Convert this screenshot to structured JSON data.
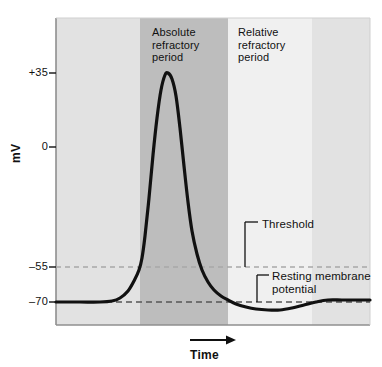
{
  "figure": {
    "background_color": "#ffffff"
  },
  "axes": {
    "y_title": "mV",
    "x_title": "Time",
    "y_ticks": [
      {
        "label": "+35",
        "value": 35,
        "y": 73
      },
      {
        "label": "0",
        "value": 0,
        "y": 147
      },
      {
        "label": "–55",
        "value": -55,
        "y": 267
      },
      {
        "label": "–70",
        "value": -70,
        "y": 302
      }
    ],
    "plot_rect": {
      "left": 56,
      "top": 18,
      "right": 370,
      "bottom": 325
    },
    "frame_color": "#8f8f8f"
  },
  "bands": [
    {
      "name": "pre-stimulus",
      "label": "",
      "x0": 56,
      "x1": 140,
      "color": "#e2e2e2"
    },
    {
      "name": "absolute-refractory",
      "label": "Absolute\nrefractory\nperiod",
      "x0": 140,
      "x1": 228,
      "color": "#bdbdbd",
      "label_x": 152,
      "label_y": 26
    },
    {
      "name": "relative-refractory",
      "label": "Relative\nrefractory\nperiod",
      "x0": 228,
      "x1": 312,
      "color": "#f0f0f0",
      "label_x": 238,
      "label_y": 26
    },
    {
      "name": "post-refractory",
      "label": "",
      "x0": 312,
      "x1": 370,
      "color": "#e2e2e2"
    }
  ],
  "reference_lines": [
    {
      "name": "threshold-line",
      "value": -55,
      "y": 267,
      "color": "#a8a8a8",
      "dash": "5,4"
    },
    {
      "name": "resting-potential-line",
      "value": -70,
      "y": 302,
      "color": "#555555",
      "dash": "6,4"
    }
  ],
  "annotations": [
    {
      "name": "threshold",
      "text": "Threshold",
      "label_x": 262,
      "label_y": 218,
      "leader": {
        "x": 245,
        "y_top": 222,
        "y_bottom": 267,
        "tick_x2": 258,
        "tick_y": 222
      }
    },
    {
      "name": "resting-membrane-potential",
      "text": "Resting membrane\npotential",
      "label_x": 272,
      "label_y": 270,
      "leader": {
        "x": 257,
        "y_top": 275,
        "y_bottom": 302,
        "tick_x2": 269,
        "tick_y": 275
      }
    }
  ],
  "time_arrow": {
    "name": "time-arrow",
    "x0": 190,
    "x1": 236,
    "y": 340
  },
  "curve": {
    "name": "action-potential-curve",
    "color": "#111111",
    "width": 3.2,
    "resting_mv": -70,
    "threshold_mv": -55,
    "peak_mv": 35,
    "undershoot_mv": -76,
    "points_px": [
      [
        56,
        302
      ],
      [
        80,
        302
      ],
      [
        100,
        302
      ],
      [
        112,
        301
      ],
      [
        120,
        298
      ],
      [
        128,
        291
      ],
      [
        134,
        281
      ],
      [
        139,
        270
      ],
      [
        142,
        258
      ],
      [
        145,
        236
      ],
      [
        149,
        198
      ],
      [
        153,
        155
      ],
      [
        157,
        118
      ],
      [
        161,
        90
      ],
      [
        165,
        75
      ],
      [
        168,
        73
      ],
      [
        172,
        79
      ],
      [
        176,
        96
      ],
      [
        180,
        128
      ],
      [
        184,
        166
      ],
      [
        188,
        202
      ],
      [
        192,
        231
      ],
      [
        197,
        254
      ],
      [
        202,
        270
      ],
      [
        208,
        282
      ],
      [
        214,
        290
      ],
      [
        221,
        296
      ],
      [
        228,
        300
      ],
      [
        236,
        304
      ],
      [
        246,
        307
      ],
      [
        256,
        309
      ],
      [
        268,
        310
      ],
      [
        280,
        310
      ],
      [
        292,
        308
      ],
      [
        304,
        305
      ],
      [
        316,
        302
      ],
      [
        328,
        300
      ],
      [
        342,
        300
      ],
      [
        356,
        300
      ],
      [
        370,
        300
      ]
    ]
  },
  "chart_data": {
    "type": "line",
    "xlabel": "Time",
    "ylabel": "mV",
    "ylim": [
      -90,
      50
    ],
    "ytick_values": [
      35,
      0,
      -55,
      -70
    ],
    "ytick_labels": [
      "+35",
      "0",
      "–55",
      "–70"
    ],
    "grid": false,
    "legend": "none",
    "series": [
      {
        "name": "Membrane potential",
        "x": [
          0,
          8,
          14,
          18,
          21,
          24,
          26,
          28,
          30,
          32,
          34,
          36,
          38,
          40,
          43,
          46,
          50,
          54,
          58,
          63,
          68,
          74,
          80,
          88,
          96,
          104,
          112,
          120,
          130,
          142,
          156,
          170,
          185,
          200
        ],
        "y": [
          -70,
          -70,
          -70,
          -69,
          -68,
          -65,
          -61,
          -57,
          -55,
          -50,
          -38,
          -20,
          3,
          22,
          33,
          35,
          33,
          25,
          10,
          -8,
          -25,
          -40,
          -52,
          -60,
          -65,
          -68,
          -71,
          -74,
          -76,
          -76,
          -75,
          -73,
          -71,
          -70
        ]
      }
    ],
    "annotations": [
      {
        "text": "Threshold",
        "y": -55
      },
      {
        "text": "Resting membrane potential",
        "y": -70
      },
      {
        "text": "Absolute refractory period",
        "x_range": [
          28,
          86
        ]
      },
      {
        "text": "Relative refractory period",
        "x_range": [
          86,
          142
        ]
      }
    ]
  }
}
